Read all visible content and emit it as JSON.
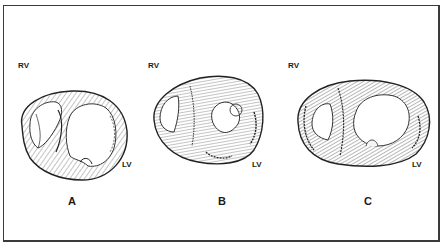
{
  "figure": {
    "panels": [
      {
        "id": "A",
        "panel_label": "A",
        "rv_label": "RV",
        "lv_label": "LV",
        "description": "Short-axis cross-section of heart, thin walls, dilated right ventricle"
      },
      {
        "id": "B",
        "panel_label": "B",
        "rv_label": "RV",
        "lv_label": "LV",
        "description": "Short-axis cross-section of heart, thickened septum and walls, small LV cavity"
      },
      {
        "id": "C",
        "panel_label": "C",
        "rv_label": "RV",
        "lv_label": "LV",
        "description": "Short-axis cross-section of heart, thickened walls, large LV cavity"
      }
    ],
    "colors": {
      "ink": "#1a1a1a",
      "border": "#3a3a3a",
      "background": "#ffffff"
    }
  }
}
